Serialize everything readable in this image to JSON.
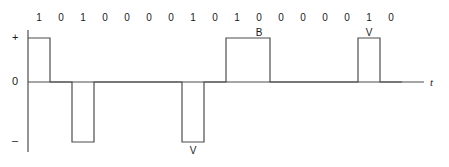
{
  "figure": {
    "title": "",
    "axis": {
      "t_label": "t",
      "plus_label": "+",
      "zero_label": "0",
      "minus_label": "–"
    },
    "geometry": {
      "origin_x": 28,
      "bit_width": 22,
      "baseline_y": 82,
      "high_y": 38,
      "low_y": 142,
      "axis_top_y": 30,
      "axis_bottom_y": 152,
      "axis_right_x": 424,
      "stroke": "#4d4d4d",
      "stroke_width": 1.2
    },
    "bits": [
      "1",
      "0",
      "1",
      "0",
      "0",
      "0",
      "0",
      "1",
      "0",
      "1",
      "0",
      "0",
      "0",
      "0",
      "0",
      "1",
      "0"
    ],
    "bit_label_y": 12,
    "levels": [
      1,
      0,
      -1,
      0,
      0,
      0,
      0,
      -1,
      0,
      1,
      1,
      0,
      0,
      0,
      0,
      1,
      0
    ],
    "annotations": [
      {
        "text": "V",
        "bit_index": 7,
        "position": "below",
        "y": 145
      },
      {
        "text": "B",
        "bit_index": 10,
        "position": "above",
        "y": 27
      },
      {
        "text": "V",
        "bit_index": 15,
        "position": "above",
        "y": 27
      }
    ]
  },
  "chart_data": {
    "type": "line",
    "xlabel": "t",
    "ylabel": "",
    "categories": [
      "1",
      "0",
      "1",
      "0",
      "0",
      "0",
      "0",
      "1",
      "0",
      "1",
      "0",
      "0",
      "0",
      "0",
      "0",
      "1",
      "0"
    ],
    "values": [
      1,
      0,
      -1,
      0,
      0,
      0,
      0,
      -1,
      0,
      1,
      1,
      0,
      0,
      0,
      0,
      1,
      0
    ],
    "ytick_labels": [
      "+",
      "0",
      "–"
    ],
    "ytick_values": [
      1,
      0,
      -1
    ],
    "ylim": [
      -1.4,
      1.4
    ],
    "grid": false,
    "legend": null,
    "annotations": [
      {
        "label": "V",
        "bit_index": 7,
        "value": -1
      },
      {
        "label": "B",
        "bit_index": 10,
        "value": 1
      },
      {
        "label": "V",
        "bit_index": 15,
        "value": 1
      }
    ]
  }
}
